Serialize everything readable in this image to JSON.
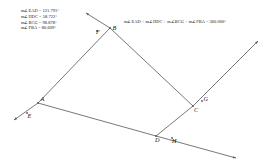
{
  "figure": {
    "type": "euclidean-geometry-sketch",
    "stroke_color": "#555555",
    "label_color": "#111111",
    "background": "#ffffff"
  },
  "measurements": {
    "lines": [
      "m∠EAD = 121.791°",
      "m∠HDC = 58.722°",
      "m∠BCG = 98.878°",
      "m∠FBA = 80.609°"
    ]
  },
  "sum": {
    "text": "m∠EAD + m∠HDC + m∠BCG + m∠FBA = 360.000°"
  },
  "points": [
    {
      "id": "A",
      "label": "A",
      "x": 38,
      "y": 103,
      "label_dx": 2.5,
      "label_dy": -2.0
    },
    {
      "id": "B",
      "label": "B",
      "x": 110,
      "y": 28,
      "label_dx": 2.5,
      "label_dy": 1.5
    },
    {
      "id": "C",
      "label": "C",
      "x": 193,
      "y": 106,
      "label_dx": 1.0,
      "label_dy": 6.0
    },
    {
      "id": "D",
      "label": "D",
      "x": 156,
      "y": 136,
      "label_dx": -1.0,
      "label_dy": 6.2
    },
    {
      "id": "E",
      "label": "E",
      "x": 27,
      "y": 113,
      "label_dx": 0.5,
      "label_dy": 5.0
    },
    {
      "id": "F",
      "label": "F",
      "x": 97,
      "y": 31,
      "label_dx": -1.0,
      "label_dy": 3.0
    },
    {
      "id": "G",
      "label": "G",
      "x": 202,
      "y": 101,
      "label_dx": 1.5,
      "label_dy": -0.5
    },
    {
      "id": "H",
      "label": "H",
      "x": 172,
      "y": 138,
      "label_dx": 0.0,
      "label_dy": 5.0
    }
  ],
  "segments": [
    {
      "name": "side-AB",
      "x1": 38,
      "y1": 103,
      "x2": 110,
      "y2": 28
    },
    {
      "name": "side-BC",
      "x1": 110,
      "y1": 28,
      "x2": 193,
      "y2": 106
    },
    {
      "name": "side-CD",
      "x1": 193,
      "y1": 106,
      "x2": 156,
      "y2": 136
    },
    {
      "name": "side-DA",
      "x1": 156,
      "y1": 136,
      "x2": 38,
      "y2": 103
    }
  ],
  "rays": [
    {
      "name": "ray-AE",
      "x1": 38,
      "y1": 103,
      "x2": 14,
      "y2": 120
    },
    {
      "name": "ray-BF",
      "x1": 110,
      "y1": 28,
      "x2": 86,
      "y2": 13
    },
    {
      "name": "ray-CG",
      "x1": 193,
      "y1": 106,
      "x2": 258,
      "y2": 41
    },
    {
      "name": "ray-DH",
      "x1": 156,
      "y1": 136,
      "x2": 236,
      "y2": 158
    }
  ],
  "arrowheads": [
    {
      "name": "arrow-E-tip",
      "x": 14,
      "y": 120
    },
    {
      "name": "arrow-F-tip",
      "x": 86,
      "y": 13
    },
    {
      "name": "arrow-G-tip",
      "x": 258,
      "y": 41
    },
    {
      "name": "arrow-H-tip",
      "x": 236,
      "y": 158
    }
  ]
}
